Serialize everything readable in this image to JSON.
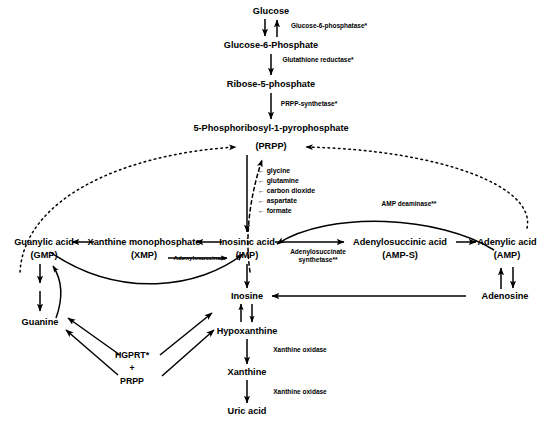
{
  "diagram": {
    "caption": "",
    "colors": {
      "ink": "#000000",
      "background": "#ffffff"
    },
    "nodes": [
      {
        "id": "glucose",
        "label": "Glucose",
        "x": 271,
        "y": 11
      },
      {
        "id": "g6p",
        "label": "Glucose-6-Phosphate",
        "x": 271,
        "y": 45
      },
      {
        "id": "r5p",
        "label": "Ribose-5-phosphate",
        "x": 271,
        "y": 84
      },
      {
        "id": "prpp_full",
        "label": "5-Phosphoribosyl-1-pyrophosphate",
        "x": 271,
        "y": 128
      },
      {
        "id": "prpp",
        "label": "(PRPP)",
        "x": 271,
        "y": 146
      },
      {
        "id": "gmp",
        "label": "Guanylic acid",
        "x": 44,
        "y": 242
      },
      {
        "id": "gmp_abbr",
        "label": "(GMP)",
        "x": 44,
        "y": 255
      },
      {
        "id": "xmp",
        "label": "Xanthine monophosphate",
        "x": 144,
        "y": 242
      },
      {
        "id": "xmp_abbr",
        "label": "(XMP)",
        "x": 144,
        "y": 255
      },
      {
        "id": "imp",
        "label": "Inosinic acid",
        "x": 247,
        "y": 242
      },
      {
        "id": "imp_abbr",
        "label": "(IMP)",
        "x": 247,
        "y": 255
      },
      {
        "id": "amps",
        "label": "Adenylosuccinic acid",
        "x": 400,
        "y": 242
      },
      {
        "id": "amps_abbr",
        "label": "(AMP-S)",
        "x": 400,
        "y": 255
      },
      {
        "id": "amp",
        "label": "Adenylic acid",
        "x": 507,
        "y": 242
      },
      {
        "id": "amp_abbr",
        "label": "(AMP)",
        "x": 507,
        "y": 255
      },
      {
        "id": "guanine",
        "label": "Guanine",
        "x": 40,
        "y": 322
      },
      {
        "id": "inosine",
        "label": "Inosine",
        "x": 247,
        "y": 296
      },
      {
        "id": "adenosine",
        "label": "Adenosine",
        "x": 505,
        "y": 296
      },
      {
        "id": "hypox",
        "label": "Hypoxanthine",
        "x": 247,
        "y": 331
      },
      {
        "id": "xanthine",
        "label": "Xanthine",
        "x": 247,
        "y": 372
      },
      {
        "id": "uricacid",
        "label": "Uric acid",
        "x": 247,
        "y": 411
      }
    ],
    "enzymes": [
      {
        "id": "g6pase",
        "label": "Glucose-6-phosphatase*",
        "x": 329,
        "y": 26
      },
      {
        "id": "gsh_red",
        "label": "Glutathione reductase*",
        "x": 318,
        "y": 60
      },
      {
        "id": "prpp_synth",
        "label": "PRPP-synthetase*",
        "x": 309,
        "y": 104
      },
      {
        "id": "amp_deam",
        "label": "AMP deaminase**",
        "x": 409,
        "y": 204
      },
      {
        "id": "xo1",
        "label": "Xanthine oxidase",
        "x": 300,
        "y": 350
      },
      {
        "id": "xo2",
        "label": "Xanthine oxidase",
        "x": 300,
        "y": 392
      }
    ],
    "enzymes_multiline": [
      {
        "id": "ads_synth",
        "line1": "Adenylosuccinate",
        "line2": "synthetase**",
        "x": 318,
        "y": 256
      }
    ],
    "substrates": {
      "x": 258,
      "y": 168,
      "arrow": "←",
      "items": [
        "glycine",
        "glutamine",
        "carbon dioxide",
        "aspartate",
        "formate"
      ]
    },
    "salvage": {
      "lines": [
        "HGPRT*",
        "+",
        "PRPP"
      ],
      "x": 132,
      "y": 364
    },
    "sidelabels": [
      {
        "id": "adenylosuccinate_in",
        "label": "Adenylosuccinate",
        "x": 200,
        "y": 258
      }
    ]
  }
}
